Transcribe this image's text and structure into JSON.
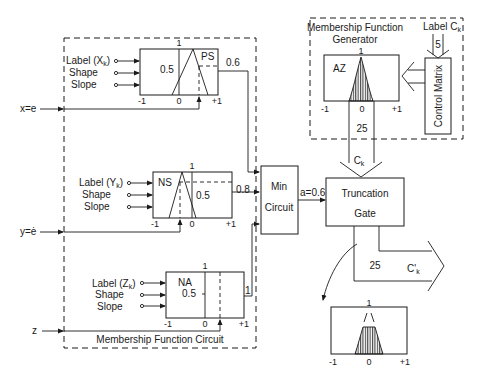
{
  "diagram": {
    "colors": {
      "line": "#1a1a1a",
      "background": "#ffffff"
    },
    "inputs": {
      "x": "x=e",
      "y": "y=ė",
      "z": "z"
    },
    "membership_circuit": {
      "title": "Membership Function Circuit",
      "blocks": [
        {
          "id": "x",
          "label_input": "Label (X",
          "label_sub": "k",
          "label_close": ")",
          "shape": "Shape",
          "slope": "Slope",
          "set_name": "PS",
          "half": "0.5",
          "top": "1",
          "axis_min": "-1",
          "axis_zero": "0",
          "axis_max": "+1",
          "output": "0.6"
        },
        {
          "id": "y",
          "label_input": "Label (Y",
          "label_sub": "k",
          "label_close": ")",
          "shape": "Shape",
          "slope": "Slope",
          "set_name": "NS",
          "half": "0.5",
          "top": "1",
          "axis_min": "-1",
          "axis_zero": "0",
          "axis_max": "+1",
          "output": "0.8"
        },
        {
          "id": "z",
          "label_input": "Label (Z",
          "label_sub": "k",
          "label_close": ")",
          "shape": "Shape",
          "slope": "Slope",
          "set_name": "NA",
          "half": "0.5",
          "top": "1",
          "axis_min": "-1",
          "axis_zero": "0",
          "axis_max": "+1",
          "output": "1"
        }
      ]
    },
    "min_circuit": {
      "line1": "Min",
      "line2": "Circuit",
      "output": "a=0.6"
    },
    "generator": {
      "title_line1": "Membership Function",
      "title_line2": "Generator",
      "set_name": "AZ",
      "top": "1",
      "axis_min": "-1",
      "axis_zero": "0",
      "axis_max": "+1",
      "bus_width": "25",
      "bus_label": "C",
      "bus_sub": "k",
      "control_matrix": "Control Matrix",
      "label_input": "Label C",
      "label_sub": "k",
      "label_width": "5"
    },
    "truncation_gate": {
      "line1": "Truncation",
      "line2": "Gate",
      "bus_width": "25",
      "output_label": "C'",
      "output_sub": "k"
    },
    "result_plot": {
      "top": "1",
      "axis_min": "-1",
      "axis_zero": "0",
      "axis_max": "+1"
    }
  }
}
